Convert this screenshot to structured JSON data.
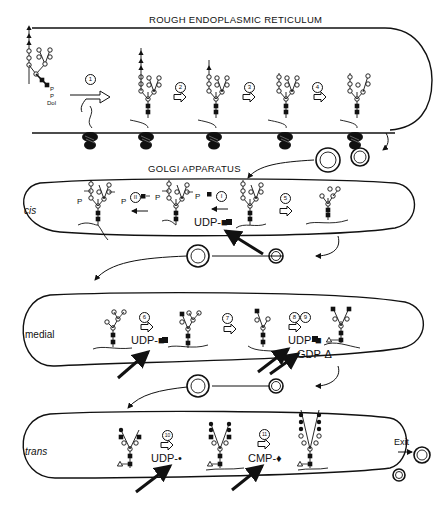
{
  "titles": {
    "rer": "ROUGH ENDOPLASMIC RETICULUM",
    "golgi": "GOLGI APPARATUS"
  },
  "compartments": {
    "cis": "cis",
    "medial": "medial",
    "trans": "trans"
  },
  "labels": {
    "dolichol_p1": "P",
    "dolichol_p2": "P",
    "dolichol": "Dol",
    "exit": "Exit",
    "phosphate": "P"
  },
  "steps": {
    "s1": "1",
    "s2": "2",
    "s3": "3",
    "s4": "4",
    "s5": "5",
    "s6": "6",
    "s7": "7",
    "s8": "8",
    "s9": "9",
    "s10": "10",
    "s11": "11",
    "sI": "I",
    "sII": "II"
  },
  "reagents": {
    "cis_udp": "UDP-■",
    "medial_udp_6": "UDP-■",
    "medial_udp_8": "UDP-■",
    "medial_gdp": "GDP-Δ",
    "trans_udp": "UDP-•",
    "trans_cmp": "CMP-♦"
  },
  "legend_symbols": {
    "glucose": "filled-triangle",
    "mannose": "open-circle",
    "n_acetylglucosamine": "filled-square",
    "fucose": "open-triangle",
    "galactose": "filled-circle",
    "sialic_acid": "filled-diamond"
  },
  "colors": {
    "ink": "#111111",
    "background": "#ffffff"
  }
}
